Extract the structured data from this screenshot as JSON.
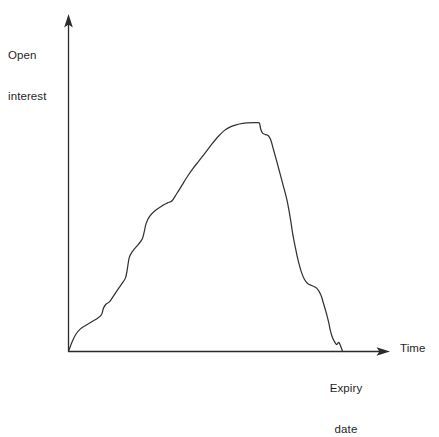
{
  "chart_data": {
    "type": "line",
    "title": "",
    "subtitle": "",
    "xlabel": "Time",
    "ylabel": "Open interest",
    "ylabel_lines": [
      "Open",
      "interest"
    ],
    "grid": false,
    "legend": false,
    "legend_position": "none",
    "axis_style": "arrow",
    "tick_labels_x": [],
    "tick_labels_y": [],
    "xlim": [
      0,
      1
    ],
    "ylim": [
      0,
      1
    ],
    "annotations": [
      {
        "name": "expiry-date",
        "text": "Expiry date",
        "text_lines": [
          "Expiry",
          "date"
        ],
        "x": 0.854,
        "y": 0
      }
    ],
    "series": [
      {
        "name": "open-interest",
        "color": "#333333",
        "points": [
          [
            0.0,
            0.0
          ],
          [
            0.016,
            0.039
          ],
          [
            0.034,
            0.072
          ],
          [
            0.056,
            0.096
          ],
          [
            0.084,
            0.113
          ],
          [
            0.112,
            0.128
          ],
          [
            0.14,
            0.143
          ],
          [
            0.159,
            0.159
          ],
          [
            0.168,
            0.186
          ],
          [
            0.18,
            0.203
          ],
          [
            0.199,
            0.215
          ],
          [
            0.227,
            0.253
          ],
          [
            0.255,
            0.289
          ],
          [
            0.274,
            0.316
          ],
          [
            0.283,
            0.355
          ],
          [
            0.292,
            0.403
          ],
          [
            0.308,
            0.43
          ],
          [
            0.336,
            0.46
          ],
          [
            0.355,
            0.484
          ],
          [
            0.364,
            0.513
          ],
          [
            0.373,
            0.549
          ],
          [
            0.389,
            0.579
          ],
          [
            0.417,
            0.605
          ],
          [
            0.451,
            0.626
          ],
          [
            0.476,
            0.638
          ],
          [
            0.498,
            0.647
          ],
          [
            0.52,
            0.677
          ],
          [
            0.545,
            0.713
          ],
          [
            0.57,
            0.749
          ],
          [
            0.598,
            0.785
          ],
          [
            0.629,
            0.82
          ],
          [
            0.66,
            0.856
          ],
          [
            0.691,
            0.892
          ],
          [
            0.722,
            0.925
          ],
          [
            0.75,
            0.949
          ],
          [
            0.778,
            0.964
          ],
          [
            0.806,
            0.973
          ],
          [
            0.837,
            0.979
          ],
          [
            0.862,
            0.981
          ],
          [
            0.89,
            0.982
          ],
          [
            0.906,
            0.982
          ],
          [
            0.918,
            0.98
          ],
          [
            0.924,
            0.955
          ],
          [
            0.933,
            0.937
          ],
          [
            0.948,
            0.931
          ],
          [
            0.961,
            0.926
          ],
          [
            0.973,
            0.907
          ],
          [
            0.985,
            0.868
          ],
          [
            1.0,
            0.82
          ],
          [
            1.016,
            0.767
          ],
          [
            1.032,
            0.713
          ],
          [
            1.048,
            0.659
          ],
          [
            1.06,
            0.606
          ],
          [
            1.07,
            0.552
          ],
          [
            1.079,
            0.499
          ],
          [
            1.091,
            0.445
          ],
          [
            1.104,
            0.391
          ],
          [
            1.119,
            0.343
          ],
          [
            1.134,
            0.31
          ],
          [
            1.15,
            0.292
          ],
          [
            1.169,
            0.283
          ],
          [
            1.194,
            0.271
          ],
          [
            1.213,
            0.244
          ],
          [
            1.225,
            0.209
          ],
          [
            1.238,
            0.17
          ],
          [
            1.25,
            0.128
          ],
          [
            1.259,
            0.09
          ],
          [
            1.269,
            0.06
          ],
          [
            1.281,
            0.039
          ],
          [
            1.29,
            0.03
          ],
          [
            1.3,
            0.039
          ],
          [
            1.309,
            0.021
          ],
          [
            1.318,
            0.0
          ]
        ]
      }
    ]
  },
  "axes": {
    "y_axis": {
      "name": "y-axis",
      "label_lines": [
        "Open",
        "interest"
      ]
    },
    "x_axis": {
      "name": "x-axis",
      "label": "Time"
    }
  },
  "colors": {
    "background": "#ffffff",
    "axis": "#2b2b2b",
    "curve": "#333333",
    "text": "#1f1f1f"
  }
}
